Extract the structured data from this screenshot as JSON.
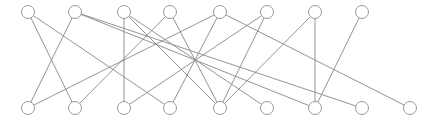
{
  "diagram": {
    "type": "bipartite-graph",
    "width": 434,
    "height": 123,
    "node_radius": 6.5,
    "colors": {
      "edge": "#888888",
      "node_stroke": "#999999",
      "node_fill": "#ffffff",
      "background": "#ffffff"
    },
    "top_row": {
      "y": 12,
      "nodes": [
        {
          "id": "t0",
          "x": 28
        },
        {
          "id": "t1",
          "x": 75
        },
        {
          "id": "t2",
          "x": 124
        },
        {
          "id": "t3",
          "x": 170
        },
        {
          "id": "t4",
          "x": 220
        },
        {
          "id": "t5",
          "x": 267
        },
        {
          "id": "t6",
          "x": 315
        },
        {
          "id": "t7",
          "x": 362
        }
      ]
    },
    "bottom_row": {
      "y": 108,
      "nodes": [
        {
          "id": "b0",
          "x": 28
        },
        {
          "id": "b1",
          "x": 75
        },
        {
          "id": "b2",
          "x": 124
        },
        {
          "id": "b3",
          "x": 170
        },
        {
          "id": "b4",
          "x": 220
        },
        {
          "id": "b5",
          "x": 267
        },
        {
          "id": "b6",
          "x": 315
        },
        {
          "id": "b7",
          "x": 362
        },
        {
          "id": "b8",
          "x": 410
        }
      ]
    },
    "edges": [
      [
        "t0",
        "b1"
      ],
      [
        "t0",
        "b3"
      ],
      [
        "t1",
        "b0"
      ],
      [
        "t1",
        "b6"
      ],
      [
        "t1",
        "b7"
      ],
      [
        "t2",
        "b2"
      ],
      [
        "t2",
        "b4"
      ],
      [
        "t2",
        "b5"
      ],
      [
        "t3",
        "b1"
      ],
      [
        "t3",
        "b4"
      ],
      [
        "t4",
        "b0"
      ],
      [
        "t4",
        "b3"
      ],
      [
        "t4",
        "b8"
      ],
      [
        "t5",
        "b2"
      ],
      [
        "t5",
        "b4"
      ],
      [
        "t6",
        "b4"
      ],
      [
        "t6",
        "b6"
      ],
      [
        "t7",
        "b6"
      ]
    ]
  }
}
